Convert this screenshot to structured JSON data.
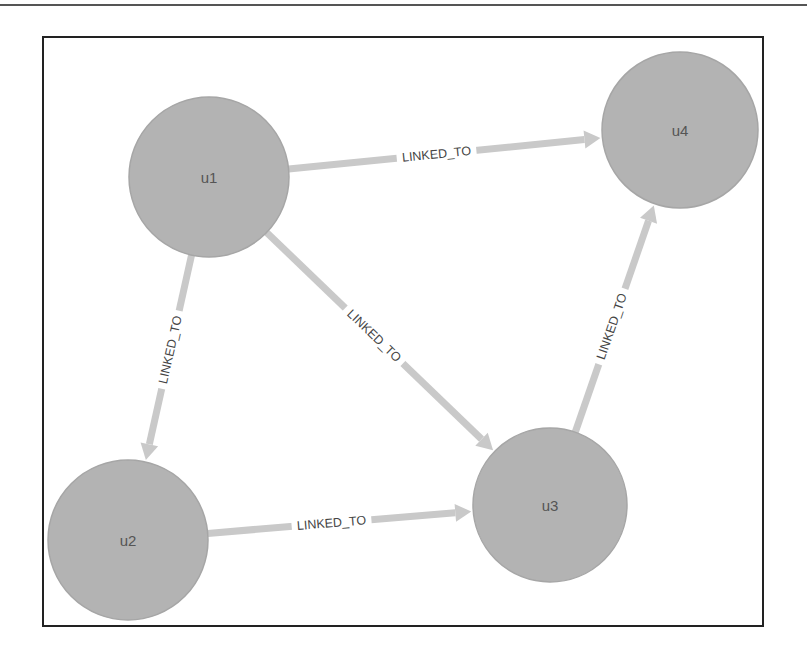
{
  "diagram": {
    "type": "directed-graph",
    "node_color": "#b3b3b3",
    "edge_color": "#c9c9c9",
    "label_color": "#444444",
    "nodes": [
      {
        "id": "u1",
        "label": "u1",
        "cx": 209,
        "cy": 177,
        "r": 80
      },
      {
        "id": "u4",
        "label": "u4",
        "cx": 680,
        "cy": 130,
        "r": 78
      },
      {
        "id": "u2",
        "label": "u2",
        "cx": 128,
        "cy": 540,
        "r": 80
      },
      {
        "id": "u3",
        "label": "u3",
        "cx": 550,
        "cy": 505,
        "r": 77
      }
    ],
    "edges": [
      {
        "from": "u1",
        "to": "u4",
        "label": "LINKED_TO"
      },
      {
        "from": "u1",
        "to": "u2",
        "label": "LINKED_TO"
      },
      {
        "from": "u1",
        "to": "u3",
        "label": "LINKED_TO"
      },
      {
        "from": "u3",
        "to": "u4",
        "label": "LINKED_TO"
      },
      {
        "from": "u2",
        "to": "u3",
        "label": "LINKED_TO"
      }
    ]
  }
}
